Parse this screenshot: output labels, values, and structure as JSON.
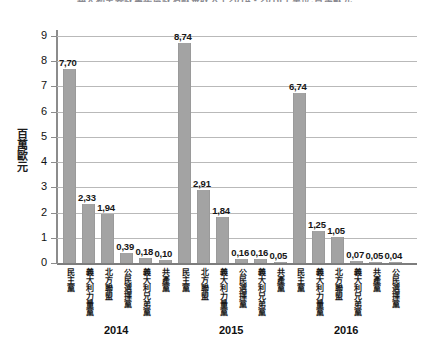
{
  "chart_data": {
    "type": "bar",
    "title": "義大利主要政黨年度政治獻金收入 ( 2014 - 2016 ) 單位:百萬歐元",
    "xlabel": "",
    "ylabel": "百萬歐元",
    "ylim": [
      0,
      9
    ],
    "yticks": [
      0,
      1,
      2,
      3,
      4,
      5,
      6,
      7,
      8,
      9
    ],
    "ytick_labels": [
      "0",
      "1",
      "2",
      "3",
      "4",
      "5",
      "6",
      "7",
      "8",
      "9"
    ],
    "grid": true,
    "legend": "none",
    "decimal_separator": ",",
    "groups": [
      {
        "year": "2014",
        "categories": [
          "民主黨",
          "義大利力量黨",
          "北方聯盟",
          "公民選擇黨",
          "義大利兄弟黨",
          "共產黨"
        ],
        "values": [
          7.7,
          2.33,
          1.94,
          0.39,
          0.18,
          0.1
        ],
        "value_labels": [
          "7,70",
          "2,33",
          "1,94",
          "0,39",
          "0,18",
          "0,10"
        ]
      },
      {
        "year": "2015",
        "categories": [
          "民主黨",
          "北方聯盟",
          "義大利力量黨",
          "公民選擇黨",
          "義大利兄弟黨",
          "共產黨"
        ],
        "values": [
          8.74,
          2.91,
          1.84,
          0.16,
          0.16,
          0.05
        ],
        "value_labels": [
          "8,74",
          "2,91",
          "1,84",
          "0,16",
          "0,16",
          "0,05"
        ]
      },
      {
        "year": "2016",
        "categories": [
          "民主黨",
          "義大利力量黨",
          "北方聯盟",
          "義大利兄弟黨",
          "共產黨",
          "公民選擇黨"
        ],
        "values": [
          6.74,
          1.25,
          1.05,
          0.07,
          0.05,
          0.04
        ],
        "value_labels": [
          "6,74",
          "1,25",
          "1,05",
          "0,07",
          "0,05",
          "0,04"
        ]
      }
    ],
    "colors": {
      "bar": "#a3a3a3",
      "grid": "#b9b9b9",
      "axis": "#8c8c8c",
      "text": "#111111",
      "background": "#ffffff"
    }
  }
}
